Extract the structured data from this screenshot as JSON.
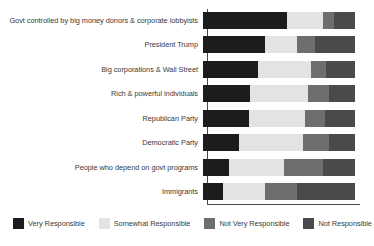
{
  "chart_data": {
    "type": "bar",
    "orientation": "horizontal",
    "stacked": true,
    "stack_mode": "percent",
    "title": "",
    "subtitle": "",
    "xlabel": "",
    "ylabel": "",
    "xlim": [
      0,
      100
    ],
    "grid": false,
    "legend_position": "bottom",
    "categories": [
      "Govt controlled by big money donors & corporate lobbyists",
      "President Trump",
      "Big corporations & Wall Street",
      "Rich & powerful individuals",
      "Republican Party",
      "Democratic Party",
      "People who depend on govt programs",
      "Immigrants"
    ],
    "series": [
      {
        "name": "Very Responsible",
        "color": "#1c1c1c",
        "values": [
          55,
          41,
          36,
          31,
          30,
          24,
          17,
          13
        ]
      },
      {
        "name": "Somewhat Responsible",
        "color": "#e3e3e1",
        "values": [
          24,
          21,
          35,
          38,
          37,
          42,
          36,
          28
        ]
      },
      {
        "name": "Not Very Responsible",
        "color": "#6e6e6e",
        "values": [
          7,
          12,
          10,
          14,
          13,
          17,
          26,
          21
        ]
      },
      {
        "name": "Not Responsible at All",
        "color": "#4a4a4a",
        "values": [
          14,
          26,
          19,
          17,
          20,
          17,
          21,
          38
        ]
      }
    ],
    "legend": [
      "Very Responsible",
      "Somewhat Responsible",
      "Not Very Responsible",
      "Not Responsible at All"
    ]
  },
  "colors": {
    "very_responsible": "#1c1c1c",
    "somewhat_responsible": "#e3e3e1",
    "not_very_responsible": "#6e6e6e",
    "not_responsible_at_all": "#4a4a4a",
    "axis": "#4a4a4a",
    "text": "#3a3a3a",
    "background": "#ffffff"
  }
}
